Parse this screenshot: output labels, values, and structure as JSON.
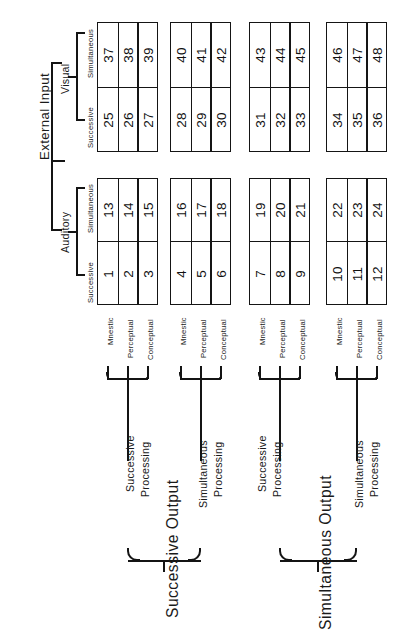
{
  "figure": {
    "root_label": "External Input",
    "stroke_color": "#151515",
    "background_color": "#ffffff"
  },
  "input_hierarchy": {
    "root": "External Input",
    "modalities": [
      {
        "name": "Auditory",
        "modes": [
          "Successive",
          "Simultaneous"
        ]
      },
      {
        "name": "Visual",
        "modes": [
          "Successive",
          "Simultaneous"
        ]
      }
    ]
  },
  "level_labels": [
    "Mnestic",
    "Perceptual",
    "Conceptual"
  ],
  "output_hierarchy": [
    {
      "name": "Successive Output",
      "branches": [
        "Successive Processing",
        "Simultaneous Processing"
      ]
    },
    {
      "name": "Simultaneous Output",
      "branches": [
        "Successive Processing",
        "Simultaneous Processing"
      ]
    }
  ],
  "processing_branch_labels": {
    "successive_line1": "Successive",
    "successive_line2": "Processing",
    "simultaneous_line1": "Simultaneous",
    "simultaneous_line2": "Processing"
  },
  "blocks": [
    {
      "id": "block-1",
      "output_group": "Successive Output",
      "processing": "Successive Processing",
      "auditory": {
        "successive": [
          "1",
          "2",
          "3"
        ],
        "simultaneous": [
          "13",
          "14",
          "15"
        ]
      },
      "visual": {
        "successive": [
          "25",
          "26",
          "27"
        ],
        "simultaneous": [
          "37",
          "38",
          "39"
        ]
      }
    },
    {
      "id": "block-2",
      "output_group": "Successive Output",
      "processing": "Simultaneous Processing",
      "auditory": {
        "successive": [
          "4",
          "5",
          "6"
        ],
        "simultaneous": [
          "16",
          "17",
          "18"
        ]
      },
      "visual": {
        "successive": [
          "28",
          "29",
          "30"
        ],
        "simultaneous": [
          "40",
          "41",
          "42"
        ]
      }
    },
    {
      "id": "block-3",
      "output_group": "Simultaneous Output",
      "processing": "Successive Processing",
      "auditory": {
        "successive": [
          "7",
          "8",
          "9"
        ],
        "simultaneous": [
          "19",
          "20",
          "21"
        ]
      },
      "visual": {
        "successive": [
          "31",
          "32",
          "33"
        ],
        "simultaneous": [
          "43",
          "44",
          "45"
        ]
      }
    },
    {
      "id": "block-4",
      "output_group": "Simultaneous Output",
      "processing": "Simultaneous Processing",
      "auditory": {
        "successive": [
          "10",
          "11",
          "12"
        ],
        "simultaneous": [
          "22",
          "23",
          "24"
        ]
      },
      "visual": {
        "successive": [
          "34",
          "35",
          "36"
        ],
        "simultaneous": [
          "46",
          "47",
          "48"
        ]
      }
    }
  ]
}
